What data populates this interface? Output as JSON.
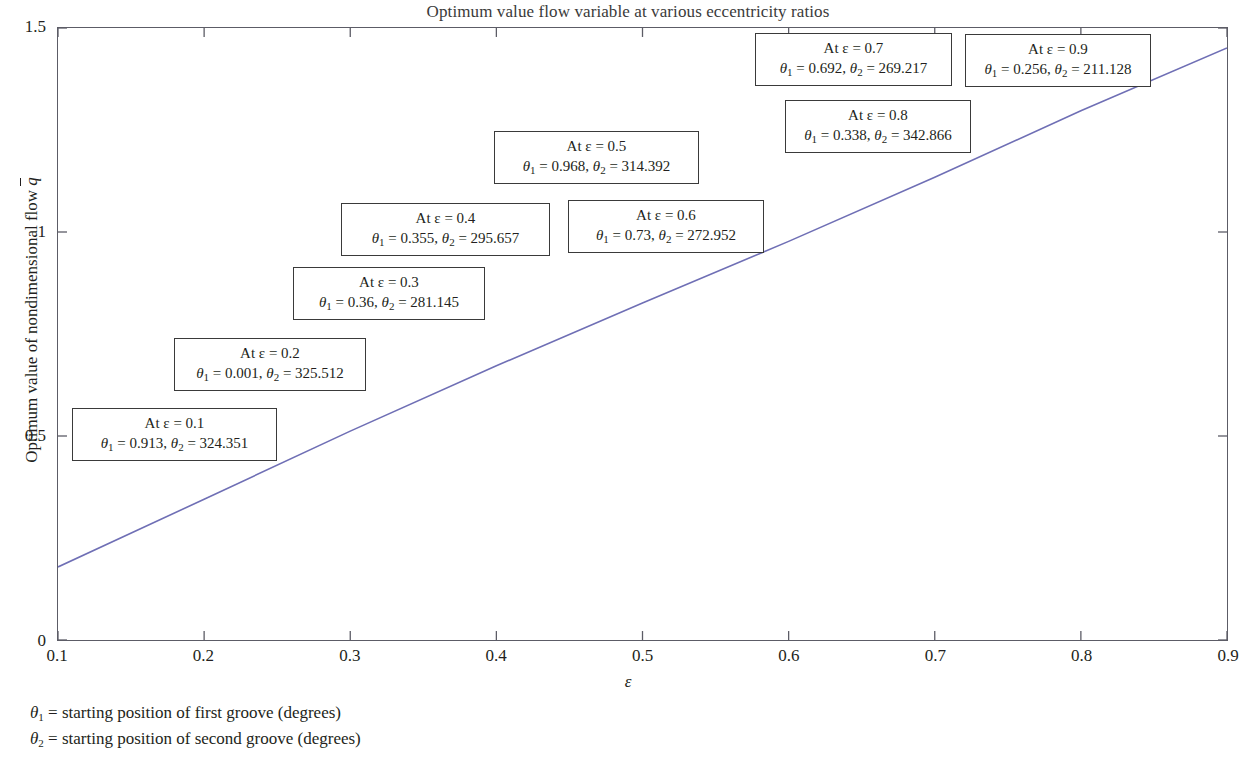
{
  "chart_data": {
    "type": "line",
    "title": "Optimum value flow variable at various eccentricity ratios",
    "xlabel": "ε",
    "ylabel": "Optimum value of nondimensional flow q̄",
    "xlim": [
      0.1,
      0.9
    ],
    "ylim": [
      0,
      1.5
    ],
    "xticks": [
      "0.1",
      "0.2",
      "0.3",
      "0.4",
      "0.5",
      "0.6",
      "0.7",
      "0.8",
      "0.9"
    ],
    "xtick_values": [
      0.1,
      0.2,
      0.3,
      0.4,
      0.5,
      0.6,
      0.7,
      0.8,
      0.9
    ],
    "yticks": [
      "0",
      "0.5",
      "1",
      "1.5"
    ],
    "ytick_values": [
      0,
      0.5,
      1,
      1.5
    ],
    "grid": false,
    "legend": "none",
    "line_color": "#6f6fb5",
    "series": [
      {
        "name": "Optimum nondimensional flow",
        "x": [
          0.1,
          0.2,
          0.3,
          0.4,
          0.5,
          0.6,
          0.7,
          0.8,
          0.9
        ],
        "values": [
          0.179,
          0.345,
          0.512,
          0.672,
          0.826,
          0.977,
          1.134,
          1.297,
          1.451
        ]
      }
    ],
    "annotations": [
      {
        "eps": "0.1",
        "line1": "At ε = 0.1",
        "theta1": "0.913",
        "theta2": "324.351"
      },
      {
        "eps": "0.2",
        "line1": "At ε = 0.2",
        "theta1": "0.001",
        "theta2": "325.512"
      },
      {
        "eps": "0.3",
        "line1": "At ε = 0.3",
        "theta1": "0.36",
        "theta2": "281.145"
      },
      {
        "eps": "0.4",
        "line1": "At ε = 0.4",
        "theta1": "0.355",
        "theta2": "295.657"
      },
      {
        "eps": "0.5",
        "line1": "At ε = 0.5",
        "theta1": "0.968",
        "theta2": "314.392"
      },
      {
        "eps": "0.6",
        "line1": "At ε = 0.6",
        "theta1": "0.73",
        "theta2": "272.952"
      },
      {
        "eps": "0.7",
        "line1": "At ε = 0.7",
        "theta1": "0.692",
        "theta2": "269.217"
      },
      {
        "eps": "0.8",
        "line1": "At ε = 0.8",
        "theta1": "0.338",
        "theta2": "342.866"
      },
      {
        "eps": "0.9",
        "line1": "At ε = 0.9",
        "theta1": "0.256",
        "theta2": "211.128"
      }
    ],
    "footnotes": [
      {
        "symbol": "θ",
        "sub": "1",
        "text": " = starting position of first groove (degrees)"
      },
      {
        "symbol": "θ",
        "sub": "2",
        "text": " = starting position of second groove (degrees)"
      }
    ]
  },
  "annotation_boxes_px": [
    {
      "left": 72,
      "top": 408,
      "width": 205
    },
    {
      "left": 174,
      "top": 338,
      "width": 192
    },
    {
      "left": 293,
      "top": 267,
      "width": 192
    },
    {
      "left": 341,
      "top": 203,
      "width": 209
    },
    {
      "left": 494,
      "top": 131,
      "width": 205
    },
    {
      "left": 568,
      "top": 200,
      "width": 196
    },
    {
      "left": 755,
      "top": 33,
      "width": 197
    },
    {
      "left": 785,
      "top": 100,
      "width": 186
    },
    {
      "left": 965,
      "top": 34,
      "width": 186
    }
  ]
}
